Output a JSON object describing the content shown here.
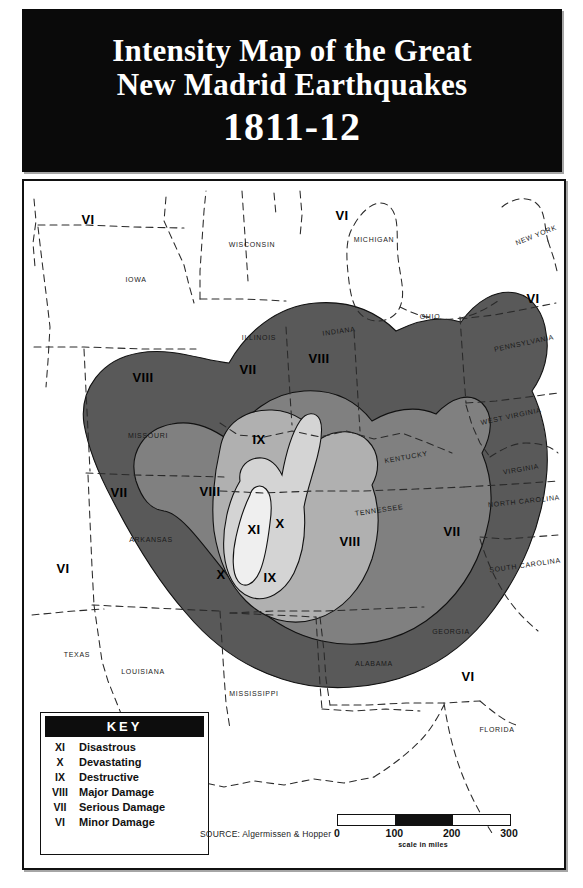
{
  "title": {
    "line1": "Intensity Map of the Great",
    "line2": "New Madrid Earthquakes",
    "year": "1811-12"
  },
  "key": {
    "header": "KEY",
    "rows": [
      {
        "roman": "XI",
        "desc": "Disastrous"
      },
      {
        "roman": "X",
        "desc": "Devastating"
      },
      {
        "roman": "IX",
        "desc": "Destructive"
      },
      {
        "roman": "VIII",
        "desc": "Major Damage"
      },
      {
        "roman": "VII",
        "desc": "Serious Damage"
      },
      {
        "roman": "VI",
        "desc": "Minor Damage"
      }
    ]
  },
  "source": "SOURCE: Algermissen & Hopper",
  "scale": {
    "caption": "scale in miles",
    "ticks": [
      "0",
      "100",
      "200",
      "300"
    ],
    "segments": [
      "plain",
      "filled",
      "plain"
    ]
  },
  "colors": {
    "zone_vi": "#ffffff",
    "zone_vii": "#595959",
    "zone_viii": "#808080",
    "zone_ix": "#b0b0b0",
    "zone_x": "#d4d4d4",
    "zone_xi": "#efefef",
    "banner": "#0a0a0a",
    "ink": "#111111"
  },
  "map": {
    "state_labels": [
      {
        "name": "WISCONSIN",
        "x": 228,
        "y": 63
      },
      {
        "name": "MICHIGAN",
        "x": 350,
        "y": 58
      },
      {
        "name": "NEW YORK",
        "x": 512,
        "y": 54,
        "rot": -22
      },
      {
        "name": "IOWA",
        "x": 112,
        "y": 98
      },
      {
        "name": "ILLINOIS",
        "x": 235,
        "y": 156
      },
      {
        "name": "INDIANA",
        "x": 315,
        "y": 150,
        "rot": -8
      },
      {
        "name": "OHIO",
        "x": 406,
        "y": 135
      },
      {
        "name": "PENNSYLVANIA",
        "x": 500,
        "y": 162,
        "rot": -12
      },
      {
        "name": "MISSOURI",
        "x": 124,
        "y": 254
      },
      {
        "name": "KENTUCKY",
        "x": 382,
        "y": 276,
        "rot": -10
      },
      {
        "name": "WEST VIRGINIA",
        "x": 487,
        "y": 235,
        "rot": -12
      },
      {
        "name": "VIRGINIA",
        "x": 497,
        "y": 288,
        "rot": -10
      },
      {
        "name": "NORTH CAROLINA",
        "x": 500,
        "y": 320,
        "rot": -6
      },
      {
        "name": "TENNESSEE",
        "x": 355,
        "y": 329,
        "rot": -8
      },
      {
        "name": "ARKANSAS",
        "x": 127,
        "y": 358
      },
      {
        "name": "SOUTH CAROLINA",
        "x": 501,
        "y": 384,
        "rot": -8
      },
      {
        "name": "GEORGIA",
        "x": 427,
        "y": 450
      },
      {
        "name": "TEXAS",
        "x": 53,
        "y": 473
      },
      {
        "name": "LOUISIANA",
        "x": 119,
        "y": 490
      },
      {
        "name": "ALABAMA",
        "x": 350,
        "y": 482
      },
      {
        "name": "MISSISSIPPI",
        "x": 230,
        "y": 512
      },
      {
        "name": "FLORIDA",
        "x": 473,
        "y": 548
      }
    ],
    "intensity_labels": [
      {
        "value": "VI",
        "x": 64,
        "y": 38
      },
      {
        "value": "VI",
        "x": 318,
        "y": 34
      },
      {
        "value": "VI",
        "x": 509,
        "y": 117
      },
      {
        "value": "VIII",
        "x": 119,
        "y": 196
      },
      {
        "value": "VII",
        "x": 224,
        "y": 188
      },
      {
        "value": "VIII",
        "x": 295,
        "y": 177
      },
      {
        "value": "IX",
        "x": 235,
        "y": 258
      },
      {
        "value": "VII",
        "x": 95,
        "y": 311
      },
      {
        "value": "VIII",
        "x": 186,
        "y": 310
      },
      {
        "value": "XI",
        "x": 230,
        "y": 348
      },
      {
        "value": "X",
        "x": 256,
        "y": 342
      },
      {
        "value": "VIII",
        "x": 326,
        "y": 360
      },
      {
        "value": "VII",
        "x": 428,
        "y": 350
      },
      {
        "value": "X",
        "x": 197,
        "y": 393
      },
      {
        "value": "IX",
        "x": 246,
        "y": 396
      },
      {
        "value": "VI",
        "x": 39,
        "y": 387
      },
      {
        "value": "VI",
        "x": 146,
        "y": 536
      },
      {
        "value": "VI",
        "x": 444,
        "y": 495
      }
    ]
  }
}
